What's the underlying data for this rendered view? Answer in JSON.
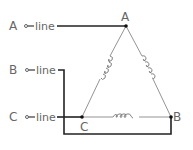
{
  "diagram": {
    "type": "delta-connected three-phase winding",
    "lines": [
      {
        "terminal": "A",
        "label": "line"
      },
      {
        "terminal": "B",
        "label": "line"
      },
      {
        "terminal": "C",
        "label": "line"
      }
    ],
    "nodes": [
      {
        "id": "A",
        "label": "A"
      },
      {
        "id": "B",
        "label": "B"
      },
      {
        "id": "C",
        "label": "C"
      }
    ],
    "coils": [
      {
        "from": "A",
        "to": "C"
      },
      {
        "from": "A",
        "to": "B"
      },
      {
        "from": "C",
        "to": "B"
      }
    ],
    "connections": [
      {
        "from": "line A",
        "to": "node A"
      },
      {
        "from": "line B",
        "to": "node B"
      },
      {
        "from": "line C",
        "to": "node C"
      }
    ],
    "colors": {
      "wire": "#222222",
      "winding": "#888888",
      "text": "#666666",
      "background": "#ffffff"
    }
  }
}
